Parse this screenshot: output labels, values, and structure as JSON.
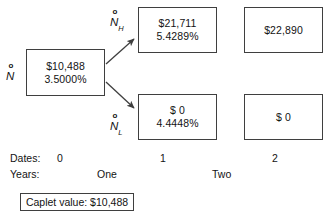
{
  "diagram": {
    "stroke_color": "#3f3f3f",
    "text_color": "#131313",
    "background_color": "#ffffff"
  },
  "node_labels": {
    "root": {
      "marker": "o",
      "symbol": "N",
      "subscript": ""
    },
    "high": {
      "marker": "o",
      "symbol": "N",
      "subscript": "H"
    },
    "low": {
      "marker": "o",
      "symbol": "N",
      "subscript": "L"
    }
  },
  "nodes": {
    "root": {
      "value": "$10,488",
      "rate": "3.5000%"
    },
    "high": {
      "value": "$21,711",
      "rate": "5.4289%"
    },
    "low": {
      "value": "$ 0",
      "rate": "4.4448%"
    },
    "high_term": {
      "value": "$22,890",
      "rate": ""
    },
    "low_term": {
      "value": "$ 0",
      "rate": ""
    }
  },
  "timeline": {
    "dates_caption": "Dates:",
    "dates": [
      "0",
      "1",
      "2"
    ],
    "years_caption": "Years:",
    "years": [
      "One",
      "Two"
    ]
  },
  "caplet": {
    "label": "Caplet value: $10,488"
  }
}
